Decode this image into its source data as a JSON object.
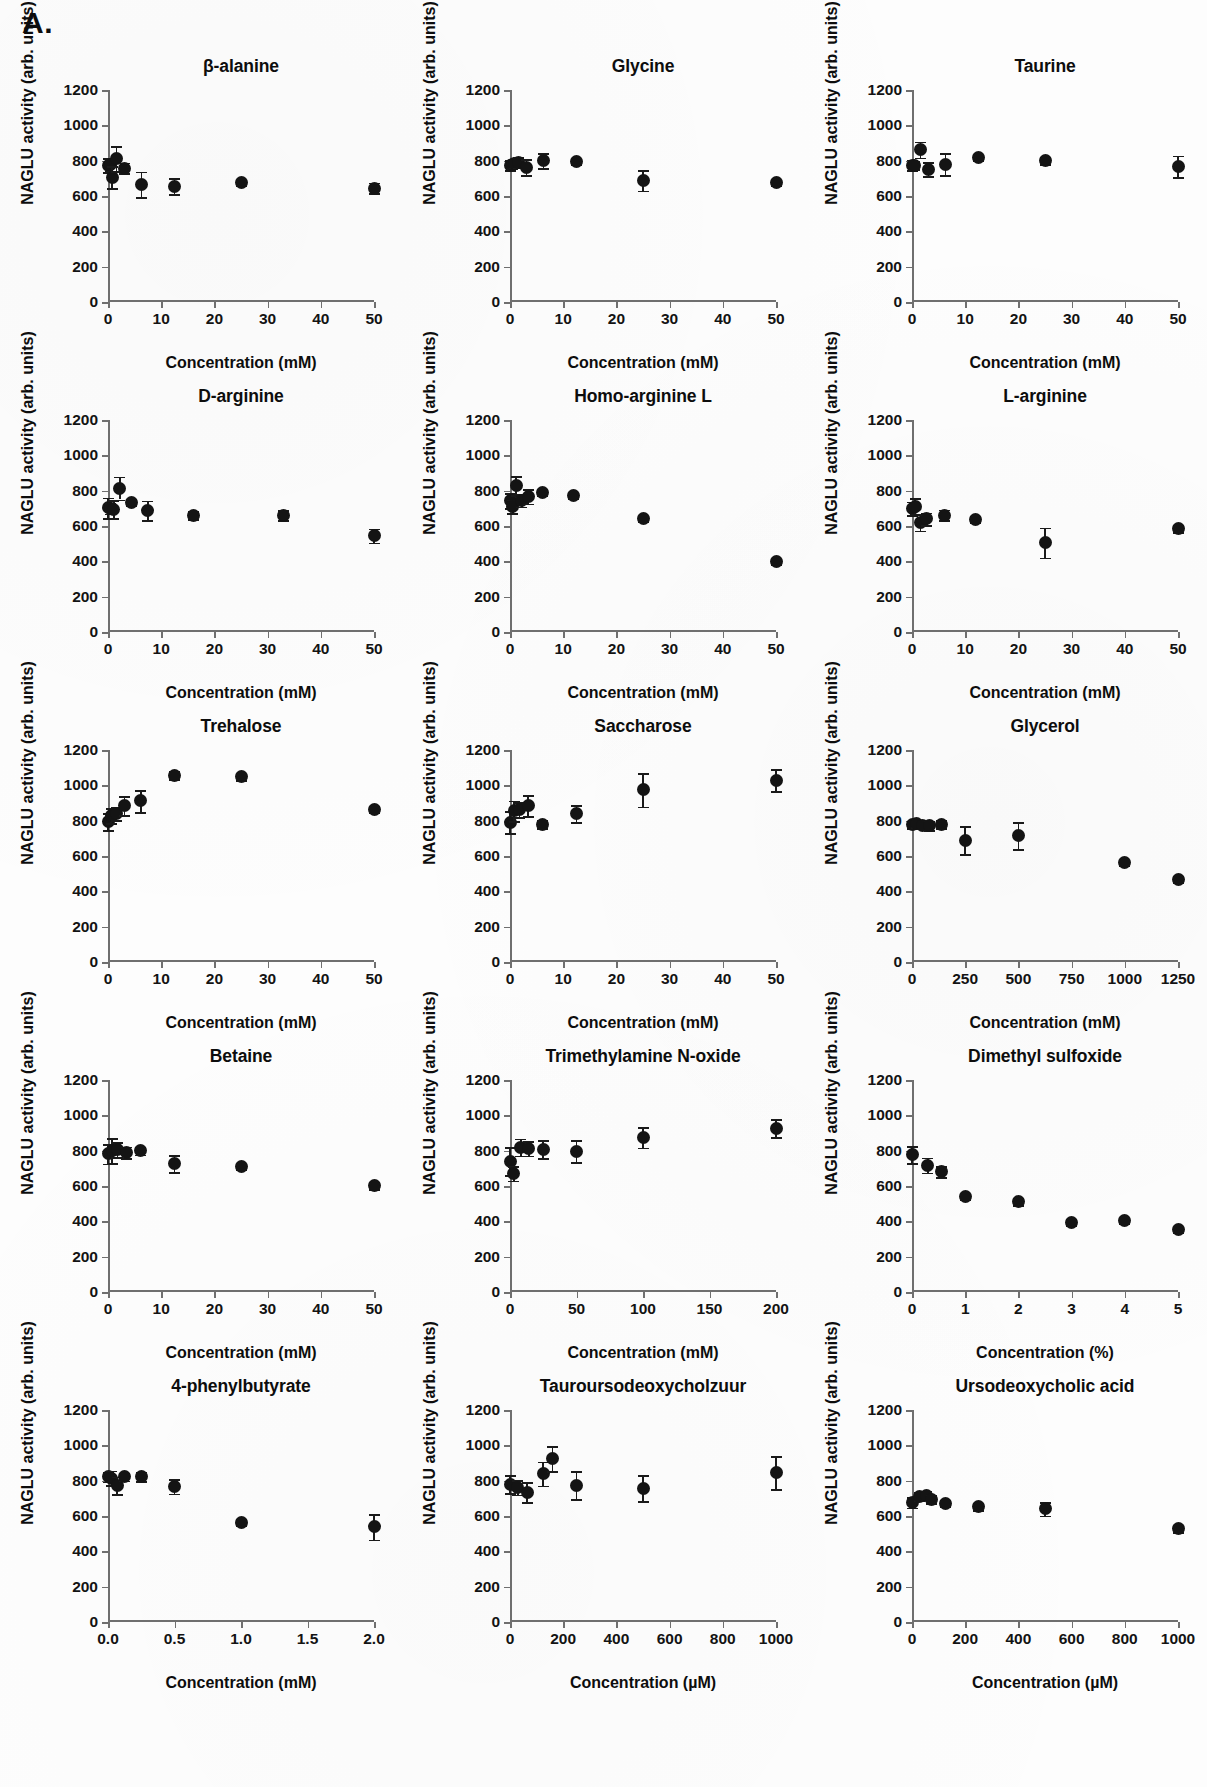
{
  "figure": {
    "panel_letter": "A.",
    "y_axis_title": "NAGLU activity (arb. units)",
    "marker_color": "#141414",
    "axis_color": "#6f6f6f"
  },
  "axis_presets": {
    "y_default": {
      "min": 0,
      "max": 1200,
      "ticks": [
        0,
        200,
        400,
        600,
        800,
        1000,
        1200
      ]
    },
    "x_mM50": {
      "min": 0,
      "max": 50,
      "ticks": [
        0,
        10,
        20,
        30,
        40,
        50
      ]
    },
    "x_mM1250": {
      "min": 0,
      "max": 1250,
      "ticks": [
        0,
        250,
        500,
        750,
        1000,
        1250
      ]
    },
    "x_mM200": {
      "min": 0,
      "max": 200,
      "ticks": [
        0,
        50,
        100,
        150,
        200
      ]
    },
    "x_pct5": {
      "min": 0,
      "max": 5,
      "ticks": [
        0,
        1,
        2,
        3,
        4,
        5
      ]
    },
    "x_mM2": {
      "min": 0,
      "max": 2,
      "ticks": [
        "0.0",
        "0.5",
        "1.0",
        "1.5",
        "2.0"
      ],
      "tickvals": [
        0,
        0.5,
        1,
        1.5,
        2
      ]
    },
    "x_uM1000": {
      "min": 0,
      "max": 1000,
      "ticks": [
        0,
        200,
        400,
        600,
        800,
        1000
      ]
    }
  },
  "chart_data": [
    {
      "type": "scatter",
      "title": "β-alanine",
      "xlabel": "Concentration (mM)",
      "ylabel": "NAGLU activity (arb. units)",
      "xaxis": "x_mM50",
      "ylim": [
        0,
        1200
      ],
      "points": [
        {
          "x": 0,
          "y": 775,
          "err": 40
        },
        {
          "x": 0.4,
          "y": 778,
          "err": 35
        },
        {
          "x": 0.8,
          "y": 705,
          "err": 62
        },
        {
          "x": 1.6,
          "y": 812,
          "err": 72
        },
        {
          "x": 3.1,
          "y": 758,
          "err": 30
        },
        {
          "x": 6.3,
          "y": 665,
          "err": 72
        },
        {
          "x": 12.5,
          "y": 655,
          "err": 45
        },
        {
          "x": 25,
          "y": 675,
          "err": 16
        },
        {
          "x": 50,
          "y": 645,
          "err": 30
        }
      ]
    },
    {
      "type": "scatter",
      "title": "Glycine",
      "xlabel": "Concentration (mM)",
      "ylabel": "NAGLU activity (arb. units)",
      "xaxis": "x_mM50",
      "ylim": [
        0,
        1200
      ],
      "points": [
        {
          "x": 0,
          "y": 775,
          "err": 28
        },
        {
          "x": 0.4,
          "y": 778,
          "err": 20
        },
        {
          "x": 0.8,
          "y": 782,
          "err": 22
        },
        {
          "x": 1.6,
          "y": 790,
          "err": 30
        },
        {
          "x": 3.1,
          "y": 762,
          "err": 45
        },
        {
          "x": 6.3,
          "y": 800,
          "err": 42
        },
        {
          "x": 12.5,
          "y": 793,
          "err": 14
        },
        {
          "x": 25,
          "y": 688,
          "err": 58
        },
        {
          "x": 50,
          "y": 675,
          "err": 16
        }
      ]
    },
    {
      "type": "scatter",
      "title": "Taurine",
      "xlabel": "Concentration (mM)",
      "ylabel": "NAGLU activity (arb. units)",
      "xaxis": "x_mM50",
      "ylim": [
        0,
        1200
      ],
      "points": [
        {
          "x": 0,
          "y": 775,
          "err": 30
        },
        {
          "x": 0.5,
          "y": 775,
          "err": 22
        },
        {
          "x": 1.6,
          "y": 862,
          "err": 45
        },
        {
          "x": 3.1,
          "y": 752,
          "err": 38
        },
        {
          "x": 6.3,
          "y": 780,
          "err": 62
        },
        {
          "x": 12.5,
          "y": 818,
          "err": 16
        },
        {
          "x": 25,
          "y": 800,
          "err": 18
        },
        {
          "x": 50,
          "y": 768,
          "err": 60
        }
      ]
    },
    {
      "type": "scatter",
      "title": "D-arginine",
      "xlabel": "Concentration (mM)",
      "ylabel": "NAGLU activity (arb. units)",
      "xaxis": "x_mM50",
      "ylim": [
        0,
        1200
      ],
      "points": [
        {
          "x": 0,
          "y": 702,
          "err": 58
        },
        {
          "x": 0.5,
          "y": 700,
          "err": 30
        },
        {
          "x": 1.1,
          "y": 695,
          "err": 50
        },
        {
          "x": 2.2,
          "y": 815,
          "err": 65
        },
        {
          "x": 4.4,
          "y": 735,
          "err": 16
        },
        {
          "x": 7.5,
          "y": 688,
          "err": 55
        },
        {
          "x": 16,
          "y": 662,
          "err": 22
        },
        {
          "x": 33,
          "y": 662,
          "err": 28
        },
        {
          "x": 50,
          "y": 545,
          "err": 40
        }
      ]
    },
    {
      "type": "scatter",
      "title": "Homo-arginine L",
      "xlabel": "Concentration (mM)",
      "ylabel": "NAGLU activity (arb. units)",
      "xaxis": "x_mM50",
      "ylim": [
        0,
        1200
      ],
      "points": [
        {
          "x": 0,
          "y": 742,
          "err": 42
        },
        {
          "x": 0.5,
          "y": 712,
          "err": 38
        },
        {
          "x": 1.2,
          "y": 828,
          "err": 55
        },
        {
          "x": 2.2,
          "y": 745,
          "err": 35
        },
        {
          "x": 3.4,
          "y": 768,
          "err": 42
        },
        {
          "x": 6.2,
          "y": 790,
          "err": 18
        },
        {
          "x": 12,
          "y": 772,
          "err": 16
        },
        {
          "x": 25,
          "y": 640,
          "err": 16
        },
        {
          "x": 50,
          "y": 400,
          "err": 16
        }
      ]
    },
    {
      "type": "scatter",
      "title": "L-arginine",
      "xlabel": "Concentration (mM)",
      "ylabel": "NAGLU activity (arb. units)",
      "xaxis": "x_mM50",
      "ylim": [
        0,
        1200
      ],
      "points": [
        {
          "x": 0,
          "y": 700,
          "err": 38
        },
        {
          "x": 0.6,
          "y": 712,
          "err": 45
        },
        {
          "x": 1.6,
          "y": 622,
          "err": 48
        },
        {
          "x": 2.8,
          "y": 640,
          "err": 36
        },
        {
          "x": 6.2,
          "y": 662,
          "err": 30
        },
        {
          "x": 12,
          "y": 638,
          "err": 18
        },
        {
          "x": 25,
          "y": 505,
          "err": 85
        },
        {
          "x": 50,
          "y": 585,
          "err": 20
        }
      ]
    },
    {
      "type": "scatter",
      "title": "Trehalose",
      "xlabel": "Concentration (mM)",
      "ylabel": "NAGLU activity (arb. units)",
      "xaxis": "x_mM50",
      "ylim": [
        0,
        1200
      ],
      "points": [
        {
          "x": 0,
          "y": 795,
          "err": 48
        },
        {
          "x": 0.6,
          "y": 828,
          "err": 42
        },
        {
          "x": 1.6,
          "y": 840,
          "err": 38
        },
        {
          "x": 3.1,
          "y": 885,
          "err": 52
        },
        {
          "x": 6.2,
          "y": 912,
          "err": 62
        },
        {
          "x": 12.5,
          "y": 1058,
          "err": 22
        },
        {
          "x": 25,
          "y": 1048,
          "err": 18
        },
        {
          "x": 50,
          "y": 865,
          "err": 20
        }
      ]
    },
    {
      "type": "scatter",
      "title": "Saccharose",
      "xlabel": "Concentration (mM)",
      "ylabel": "NAGLU activity (arb. units)",
      "xaxis": "x_mM50",
      "ylim": [
        0,
        1200
      ],
      "points": [
        {
          "x": 0,
          "y": 790,
          "err": 62
        },
        {
          "x": 0.8,
          "y": 855,
          "err": 58
        },
        {
          "x": 1.8,
          "y": 862,
          "err": 42
        },
        {
          "x": 3.4,
          "y": 885,
          "err": 58
        },
        {
          "x": 6.2,
          "y": 780,
          "err": 22
        },
        {
          "x": 12.5,
          "y": 838,
          "err": 48
        },
        {
          "x": 25,
          "y": 975,
          "err": 95
        },
        {
          "x": 50,
          "y": 1030,
          "err": 62
        }
      ]
    },
    {
      "type": "scatter",
      "title": "Glycerol",
      "xlabel": "Concentration (mM)",
      "ylabel": "NAGLU activity (arb. units)",
      "xaxis": "x_mM1250",
      "ylim": [
        0,
        1200
      ],
      "points": [
        {
          "x": 0,
          "y": 778,
          "err": 22
        },
        {
          "x": 20,
          "y": 782,
          "err": 18
        },
        {
          "x": 50,
          "y": 775,
          "err": 20
        },
        {
          "x": 80,
          "y": 772,
          "err": 24
        },
        {
          "x": 140,
          "y": 780,
          "err": 22
        },
        {
          "x": 250,
          "y": 690,
          "err": 80
        },
        {
          "x": 500,
          "y": 715,
          "err": 78
        },
        {
          "x": 1000,
          "y": 562,
          "err": 16
        },
        {
          "x": 1250,
          "y": 468,
          "err": 16
        }
      ]
    },
    {
      "type": "scatter",
      "title": "Betaine",
      "xlabel": "Concentration (mM)",
      "ylabel": "NAGLU activity (arb. units)",
      "xaxis": "x_mM50",
      "ylim": [
        0,
        1200
      ],
      "points": [
        {
          "x": 0,
          "y": 782,
          "err": 55
        },
        {
          "x": 0.8,
          "y": 800,
          "err": 70
        },
        {
          "x": 1.8,
          "y": 805,
          "err": 42
        },
        {
          "x": 3.4,
          "y": 790,
          "err": 32
        },
        {
          "x": 6.2,
          "y": 800,
          "err": 22
        },
        {
          "x": 12.5,
          "y": 725,
          "err": 48
        },
        {
          "x": 25,
          "y": 710,
          "err": 16
        },
        {
          "x": 50,
          "y": 602,
          "err": 20
        }
      ]
    },
    {
      "type": "scatter",
      "title": "Trimethylamine N-oxide",
      "xlabel": "Concentration (mM)",
      "ylabel": "NAGLU activity (arb. units)",
      "xaxis": "x_mM200",
      "ylim": [
        0,
        1200
      ],
      "points": [
        {
          "x": 0,
          "y": 740,
          "err": 78
        },
        {
          "x": 3,
          "y": 672,
          "err": 42
        },
        {
          "x": 8,
          "y": 820,
          "err": 48
        },
        {
          "x": 14,
          "y": 812,
          "err": 40
        },
        {
          "x": 25,
          "y": 808,
          "err": 52
        },
        {
          "x": 50,
          "y": 798,
          "err": 62
        },
        {
          "x": 100,
          "y": 875,
          "err": 58
        },
        {
          "x": 200,
          "y": 928,
          "err": 50
        }
      ]
    },
    {
      "type": "scatter",
      "title": "Dimethyl sulfoxide",
      "xlabel": "Concentration (%)",
      "ylabel": "NAGLU activity (arb. units)",
      "xaxis": "x_pct5",
      "ylim": [
        0,
        1200
      ],
      "points": [
        {
          "x": 0,
          "y": 778,
          "err": 48
        },
        {
          "x": 0.3,
          "y": 718,
          "err": 42
        },
        {
          "x": 0.55,
          "y": 682,
          "err": 30
        },
        {
          "x": 1,
          "y": 538,
          "err": 16
        },
        {
          "x": 2,
          "y": 512,
          "err": 22
        },
        {
          "x": 3,
          "y": 395,
          "err": 16
        },
        {
          "x": 4,
          "y": 405,
          "err": 16
        },
        {
          "x": 5,
          "y": 352,
          "err": 16
        }
      ]
    },
    {
      "type": "scatter",
      "title": "4-phenylbutyrate",
      "xlabel": "Concentration (mM)",
      "ylabel": "NAGLU activity (arb. units)",
      "xaxis": "x_mM2",
      "ylim": [
        0,
        1200
      ],
      "points": [
        {
          "x": 0,
          "y": 822,
          "err": 28
        },
        {
          "x": 0.03,
          "y": 815,
          "err": 42
        },
        {
          "x": 0.07,
          "y": 772,
          "err": 50
        },
        {
          "x": 0.125,
          "y": 822,
          "err": 22
        },
        {
          "x": 0.25,
          "y": 825,
          "err": 26
        },
        {
          "x": 0.5,
          "y": 768,
          "err": 42
        },
        {
          "x": 1.0,
          "y": 565,
          "err": 16
        },
        {
          "x": 2.0,
          "y": 538,
          "err": 72
        }
      ]
    },
    {
      "type": "scatter",
      "title": "Tauroursodeoxycholzuur",
      "xlabel": "Concentration (µM)",
      "ylabel": "NAGLU activity (arb. units)",
      "xaxis": "x_uM1000",
      "ylim": [
        0,
        1200
      ],
      "points": [
        {
          "x": 0,
          "y": 780,
          "err": 50
        },
        {
          "x": 30,
          "y": 762,
          "err": 42
        },
        {
          "x": 65,
          "y": 735,
          "err": 58
        },
        {
          "x": 125,
          "y": 840,
          "err": 68
        },
        {
          "x": 160,
          "y": 925,
          "err": 72
        },
        {
          "x": 250,
          "y": 775,
          "err": 78
        },
        {
          "x": 500,
          "y": 758,
          "err": 75
        },
        {
          "x": 1000,
          "y": 845,
          "err": 92
        }
      ]
    },
    {
      "type": "scatter",
      "title": "Ursodeoxycholic acid",
      "xlabel": "Concentration (µM)",
      "ylabel": "NAGLU activity (arb. units)",
      "xaxis": "x_uM1000",
      "ylim": [
        0,
        1200
      ],
      "points": [
        {
          "x": 0,
          "y": 678,
          "err": 30
        },
        {
          "x": 30,
          "y": 712,
          "err": 22
        },
        {
          "x": 55,
          "y": 718,
          "err": 26
        },
        {
          "x": 75,
          "y": 695,
          "err": 22
        },
        {
          "x": 125,
          "y": 672,
          "err": 18
        },
        {
          "x": 250,
          "y": 655,
          "err": 20
        },
        {
          "x": 500,
          "y": 640,
          "err": 38
        },
        {
          "x": 1000,
          "y": 528,
          "err": 18
        }
      ]
    }
  ]
}
